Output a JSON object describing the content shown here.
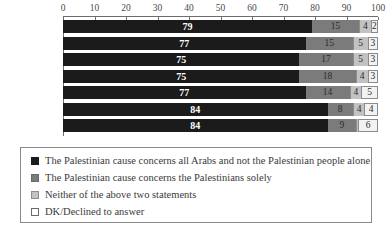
{
  "chart_data": {
    "type": "bar",
    "orientation": "horizontal",
    "stacked": true,
    "stack_mode": "percent",
    "title": "",
    "subtitle": "",
    "xlabel": "",
    "ylabel": "",
    "xlim": [
      0,
      100
    ],
    "xticks": [
      0,
      10,
      20,
      30,
      40,
      50,
      60,
      70,
      80,
      90,
      100
    ],
    "xtick_labels": [
      "0",
      "10",
      "20",
      "30",
      "40",
      "50",
      "60",
      "70",
      "80",
      "90",
      "100"
    ],
    "grid": false,
    "legend_position": "bottom",
    "categories": [
      "2019/2020",
      "2017/2018",
      "2016",
      "2015",
      "2014",
      "2012/2013",
      "2011"
    ],
    "series": [
      {
        "name": "The Palestinian cause concerns all Arabs and not the Palestinian people alone",
        "color": "#1b1b1b",
        "values": [
          79,
          77,
          75,
          75,
          77,
          84,
          84
        ],
        "labels": [
          "79",
          "77",
          "75",
          "75",
          "77",
          "84",
          "84"
        ]
      },
      {
        "name": "The Palestinian cause concerns the Palestinians solely",
        "color": "#7b7b7b",
        "values": [
          15,
          15,
          17,
          18,
          14,
          8,
          9
        ],
        "labels": [
          "15",
          "15",
          "17",
          "18",
          "14",
          "8",
          "9"
        ]
      },
      {
        "name": "Neither of the above two statements",
        "color": "#c2c2c2",
        "values": [
          4,
          5,
          5,
          4,
          4,
          4,
          1
        ],
        "labels": [
          "4",
          "5",
          "5",
          "4",
          "4",
          "4",
          ""
        ]
      },
      {
        "name": "DK/Declined to answer",
        "color": "#ffffff",
        "values": [
          2,
          3,
          3,
          3,
          5,
          4,
          6
        ],
        "labels": [
          "2",
          "3",
          "3",
          "3",
          "5",
          "4",
          "6"
        ]
      }
    ]
  }
}
